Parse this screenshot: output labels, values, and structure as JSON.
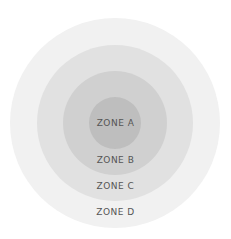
{
  "diagram": {
    "type": "concentric-zones",
    "center": [
      115,
      123
    ],
    "zones": [
      {
        "label": "ZONE D",
        "radius": 105,
        "color": "#f1f1f1",
        "label_y": 207
      },
      {
        "label": "ZONE C",
        "radius": 78,
        "color": "#e1e1e1",
        "label_y": 181
      },
      {
        "label": "ZONE B",
        "radius": 52,
        "color": "#d0d0d0",
        "label_y": 155
      },
      {
        "label": "ZONE A",
        "radius": 26,
        "color": "#bebebe",
        "label_y": 118
      }
    ]
  }
}
